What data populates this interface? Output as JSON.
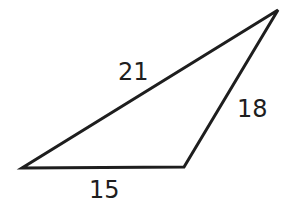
{
  "diagram": {
    "type": "triangle",
    "stroke_color": "#1e1e1e",
    "fill_color": "#ffffff",
    "vertices": {
      "left": [
        22,
        168
      ],
      "bottom_right": [
        184,
        167
      ],
      "top_right": [
        278,
        10
      ]
    },
    "sides": [
      {
        "name": "hypotenuse",
        "label": "21",
        "from": "left",
        "to": "top_right",
        "label_pos": [
          118,
          80
        ]
      },
      {
        "name": "right-side",
        "label": "18",
        "from": "bottom_right",
        "to": "top_right",
        "label_pos": [
          237,
          117
        ]
      },
      {
        "name": "base",
        "label": "15",
        "from": "left",
        "to": "bottom_right",
        "label_pos": [
          89,
          198
        ]
      }
    ]
  }
}
